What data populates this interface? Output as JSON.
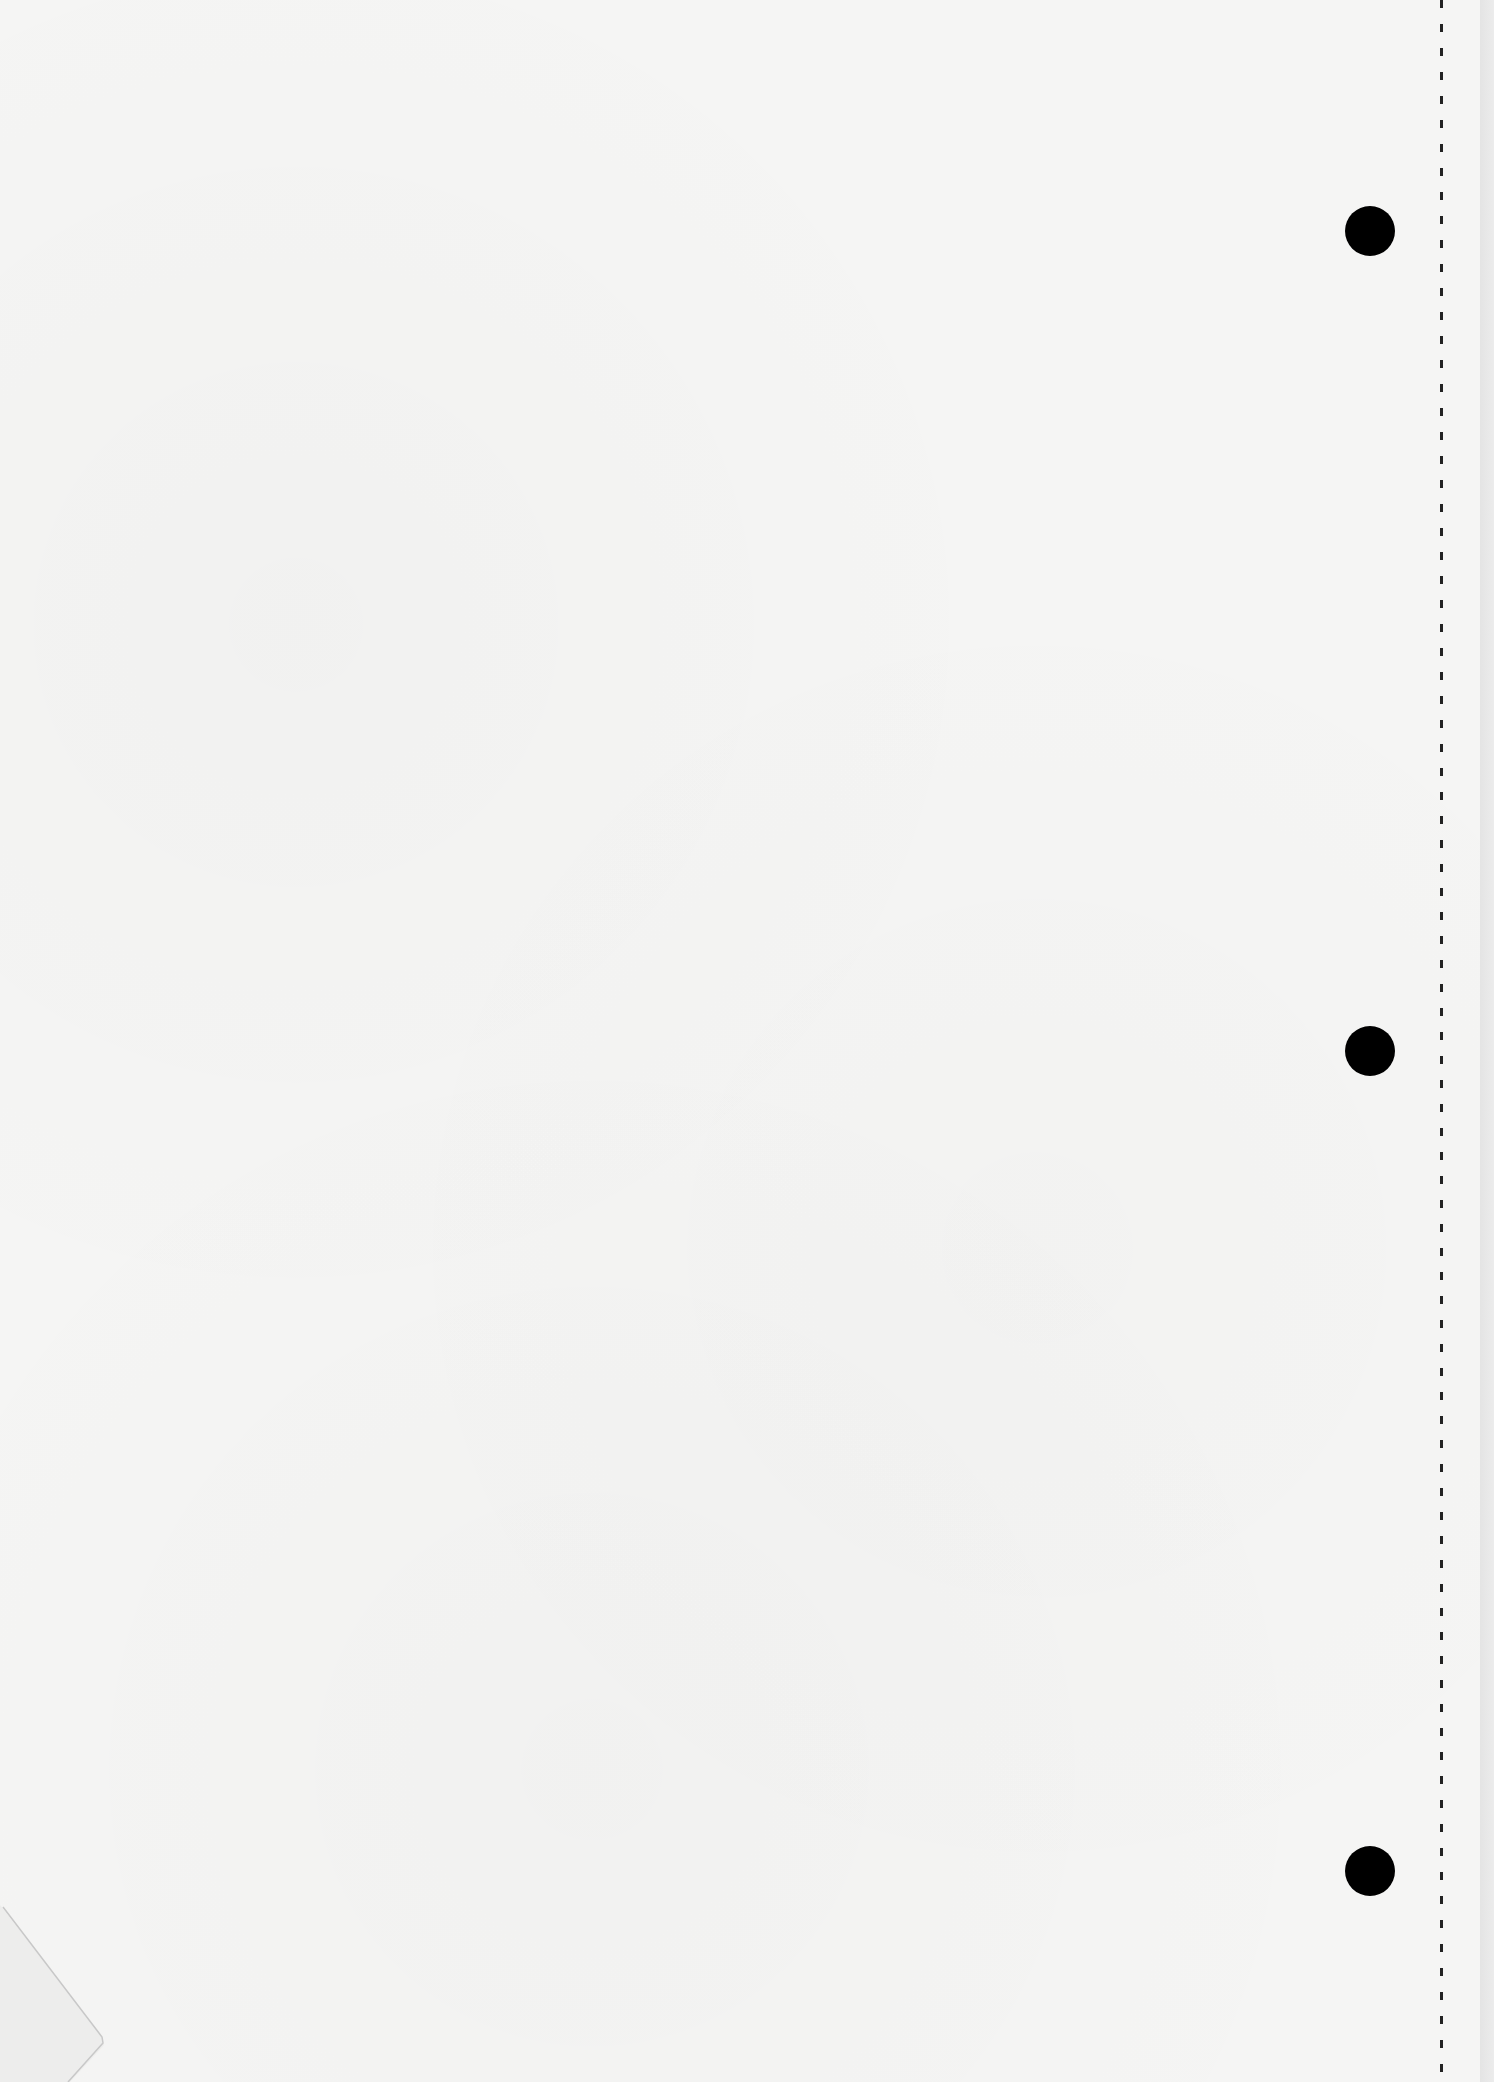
{
  "document": {
    "type": "blank loose-leaf paper sheet",
    "text": "",
    "punch_holes": 3,
    "features": [
      "right-edge-perforation",
      "three-punch-holes",
      "folded-bottom-left-corner"
    ]
  },
  "colors": {
    "paper": "#f5f5f4",
    "hole": "#000000",
    "perforation": "#222222",
    "edge_strip": "#e8e8e8"
  }
}
